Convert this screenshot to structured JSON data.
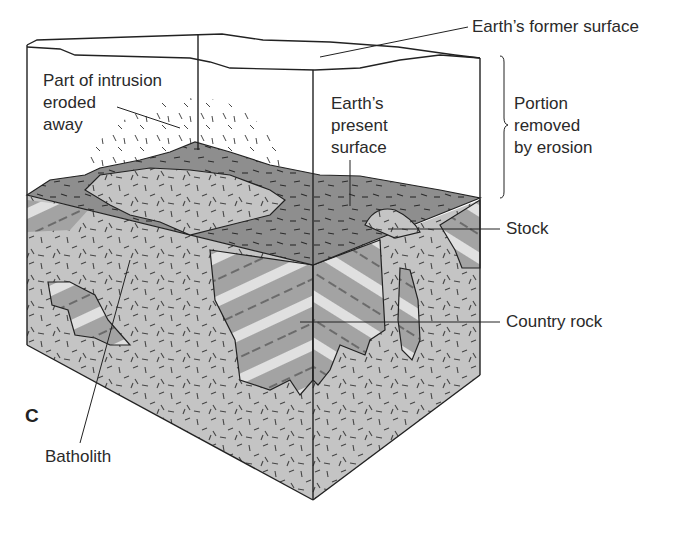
{
  "figure": {
    "panel_letter": "C",
    "labels": {
      "former_surface": "Earth’s former surface",
      "eroded_intrusion": "Part of intrusion\neroded\naway",
      "present_surface": "Earth’s\npresent\nsurface",
      "portion_removed": "Portion\nremoved\nby erosion",
      "stock": "Stock",
      "country_rock": "Country rock",
      "batholith": "Batholith"
    },
    "colors": {
      "batholith_fill": "#c4c4c4",
      "country_rock_dark": "#9a9a9a",
      "country_rock_light": "#e2e2e2",
      "surface_fill": "#8c8c8c",
      "outline": "#222222"
    }
  }
}
